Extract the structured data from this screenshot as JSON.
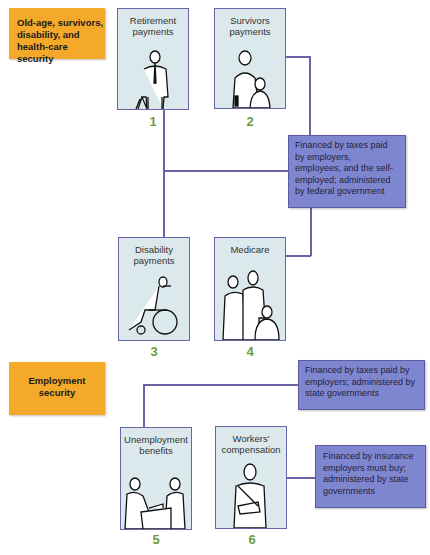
{
  "categories": [
    {
      "label": "Old-age, survivors, disability, and health-care security"
    },
    {
      "label": "Employment security"
    }
  ],
  "programs": [
    {
      "number": "1",
      "label": "Retirement payments",
      "icon": "elderly-man-with-cane"
    },
    {
      "number": "2",
      "label": "Survivors payments",
      "icon": "woman-and-child"
    },
    {
      "number": "3",
      "label": "Disability payments",
      "icon": "person-in-wheelchair"
    },
    {
      "number": "4",
      "label": "Medicare",
      "icon": "nurse-patient-visitor"
    },
    {
      "number": "5",
      "label": "Unemployment benefits",
      "icon": "two-people-at-counter"
    },
    {
      "number": "6",
      "label": "Workers' compensation",
      "icon": "man-with-arm-sling"
    }
  ],
  "financing": [
    {
      "text": "Financed by taxes paid by employers, employees, and the self-employed; administered by federal government"
    },
    {
      "text": "Financed by taxes paid by employers; administered by state governments"
    },
    {
      "text": "Financed by insurance employers must buy; administered by state governments"
    }
  ],
  "colors": {
    "category_box": "#f4a92a",
    "program_card": "#dbe9ec",
    "financing_box": "#7f86d0",
    "connector": "#6b62a8",
    "number": "#6f9a3c"
  }
}
